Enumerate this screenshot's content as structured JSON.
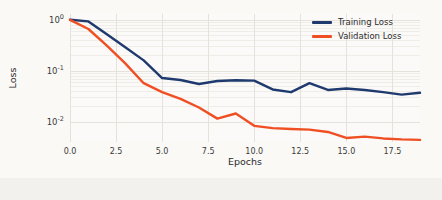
{
  "chart_data": {
    "type": "line",
    "title": "",
    "xlabel": "Epochs",
    "ylabel": "Loss",
    "yscale": "log",
    "xlim": [
      0,
      19
    ],
    "ylim": [
      0.004,
      1.3
    ],
    "grid": true,
    "legend_position": "top-right",
    "xticks": [
      "0.0",
      "2.5",
      "5.0",
      "7.5",
      "10.0",
      "12.5",
      "15.0",
      "17.5"
    ],
    "xtick_values": [
      0.0,
      2.5,
      5.0,
      7.5,
      10.0,
      12.5,
      15.0,
      17.5
    ],
    "yticks": [
      "10^0",
      "10^-1",
      "10^-2"
    ],
    "ytick_values": [
      1.0,
      0.1,
      0.01
    ],
    "ytick_mantissa": [
      "10",
      "10",
      "10"
    ],
    "ytick_exponent": [
      "0",
      "-1",
      "-2"
    ],
    "x": [
      0,
      1,
      2,
      3,
      4,
      5,
      6,
      7,
      8,
      9,
      10,
      11,
      12,
      13,
      14,
      15,
      16,
      17,
      18,
      19
    ],
    "series": [
      {
        "name": "Training Loss",
        "color": "#1f3a6e",
        "values": [
          1.0,
          0.93,
          0.52,
          0.29,
          0.16,
          0.072,
          0.066,
          0.055,
          0.063,
          0.065,
          0.064,
          0.043,
          0.038,
          0.057,
          0.042,
          0.045,
          0.042,
          0.038,
          0.034,
          0.037
        ]
      },
      {
        "name": "Validation Loss",
        "color": "#f04e23",
        "values": [
          1.0,
          0.66,
          0.31,
          0.14,
          0.057,
          0.038,
          0.028,
          0.019,
          0.0115,
          0.0145,
          0.0083,
          0.0075,
          0.0072,
          0.007,
          0.0063,
          0.0048,
          0.0051,
          0.0047,
          0.0045,
          0.0044
        ]
      }
    ]
  },
  "legend": {
    "items": [
      {
        "label": "Training Loss",
        "color": "#1f3a6e"
      },
      {
        "label": "Validation Loss",
        "color": "#f04e23"
      }
    ]
  }
}
